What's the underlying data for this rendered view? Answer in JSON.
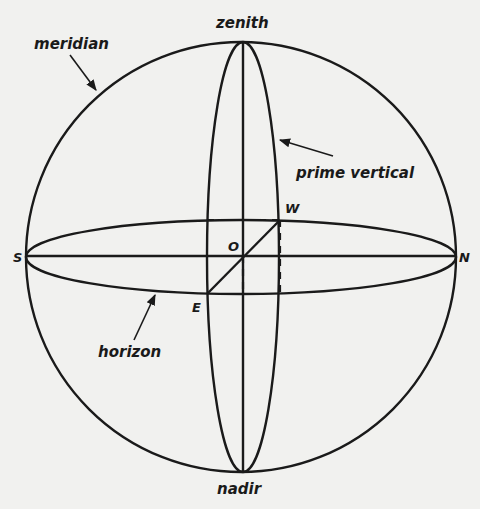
{
  "labels": {
    "zenith": "zenith",
    "nadir": "nadir",
    "meridian": "meridian",
    "prime_vertical": "prime vertical",
    "horizon": "horizon",
    "south": "S",
    "north": "N",
    "east": "E",
    "west": "W",
    "origin": "O"
  },
  "colors": {
    "ink": "#1a1a1a",
    "paper": "#f1f1ef"
  }
}
